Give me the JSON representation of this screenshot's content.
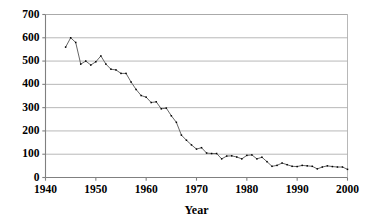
{
  "chart_data": {
    "type": "line",
    "title": "",
    "subtitle": "",
    "xlabel": "Year",
    "ylabel": "",
    "xlim": [
      1940,
      2000
    ],
    "ylim": [
      0,
      700
    ],
    "xticks": [
      1940,
      1950,
      1960,
      1970,
      1980,
      1990,
      2000
    ],
    "xtick_labels": [
      "1940",
      "1950",
      "1960",
      "1970",
      "1980",
      "1990",
      "2000"
    ],
    "yticks": [
      0,
      100,
      200,
      300,
      400,
      500,
      600,
      700
    ],
    "ytick_labels": [
      "0",
      "100",
      "200",
      "300",
      "400",
      "500",
      "600",
      "700"
    ],
    "grid": "horizontal",
    "legend": "none",
    "marker": "square",
    "line_color": "#555555",
    "marker_color": "#000000",
    "grid_color": "#a6a6a6",
    "axis_color": "#808080",
    "background": "#ffffff",
    "x": [
      1944,
      1945,
      1946,
      1947,
      1948,
      1949,
      1950,
      1951,
      1952,
      1953,
      1954,
      1955,
      1956,
      1957,
      1958,
      1959,
      1960,
      1961,
      1962,
      1963,
      1964,
      1965,
      1966,
      1967,
      1968,
      1969,
      1970,
      1971,
      1972,
      1973,
      1974,
      1975,
      1976,
      1977,
      1978,
      1979,
      1980,
      1981,
      1982,
      1983,
      1984,
      1985,
      1986,
      1987,
      1988,
      1989,
      1990,
      1991,
      1992,
      1993,
      1994,
      1995,
      1996,
      1997,
      1998,
      1999,
      2000
    ],
    "values": [
      560,
      600,
      580,
      487,
      500,
      483,
      497,
      522,
      487,
      465,
      462,
      447,
      447,
      410,
      378,
      352,
      345,
      322,
      325,
      295,
      298,
      265,
      237,
      182,
      160,
      140,
      122,
      128,
      105,
      103,
      103,
      80,
      92,
      93,
      88,
      80,
      95,
      97,
      80,
      87,
      68,
      48,
      52,
      62,
      55,
      48,
      47,
      52,
      50,
      48,
      37,
      45,
      50,
      47,
      45,
      45,
      35
    ],
    "series": [
      {
        "name": "rate",
        "values": [
          560,
          600,
          580,
          487,
          500,
          483,
          497,
          522,
          487,
          465,
          462,
          447,
          447,
          410,
          378,
          352,
          345,
          322,
          325,
          295,
          298,
          265,
          237,
          182,
          160,
          140,
          122,
          128,
          105,
          103,
          103,
          80,
          92,
          93,
          88,
          80,
          95,
          97,
          80,
          87,
          68,
          48,
          52,
          62,
          55,
          48,
          47,
          52,
          50,
          48,
          37,
          45,
          50,
          47,
          45,
          45,
          35
        ]
      }
    ]
  }
}
